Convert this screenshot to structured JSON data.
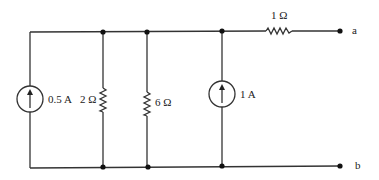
{
  "diagram": {
    "type": "circuit",
    "components": {
      "source_left": {
        "label": "0.5 A",
        "kind": "current-source",
        "direction": "up"
      },
      "resistor_2": {
        "label": "2 Ω",
        "kind": "resistor"
      },
      "resistor_6": {
        "label": "6 Ω",
        "kind": "resistor"
      },
      "source_right": {
        "label": "1 A",
        "kind": "current-source",
        "direction": "up"
      },
      "resistor_1": {
        "label": "1 Ω",
        "kind": "resistor"
      }
    },
    "terminals": {
      "a": "a",
      "b": "b"
    },
    "colors": {
      "wire": "#333333",
      "node": "#111111",
      "background": "#ffffff"
    }
  }
}
